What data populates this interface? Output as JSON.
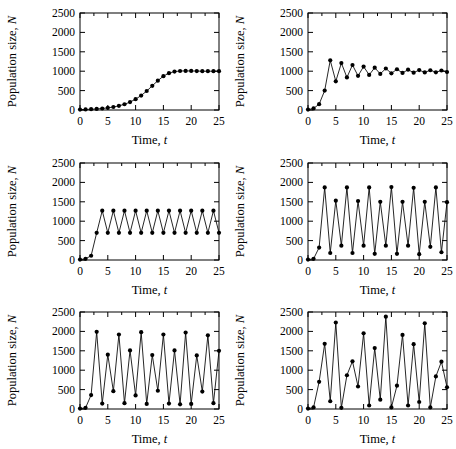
{
  "figure": {
    "panel_count": 6,
    "columns": 2,
    "rows": 3
  },
  "axes": {
    "xlabel_main": "Time, ",
    "xlabel_symbol": "t",
    "ylabel_main": "Population size, ",
    "ylabel_symbol": "N",
    "xticks": [
      0,
      5,
      10,
      15,
      20,
      25
    ],
    "yticks": [
      0,
      500,
      1000,
      1500,
      2000,
      2500
    ],
    "xtick_labels": [
      "0",
      "5",
      "10",
      "15",
      "20",
      "25"
    ],
    "ytick_labels": [
      "0",
      "500",
      "1000",
      "1500",
      "2000",
      "2500"
    ],
    "xlim": [
      0,
      25
    ],
    "ylim": [
      0,
      2500
    ],
    "tick_direction": "in",
    "grid": false,
    "minor_xticks": [
      2.5,
      7.5,
      12.5,
      17.5,
      22.5
    ]
  },
  "style": {
    "line_color": "#000000",
    "marker_color": "#000000",
    "frame_color": "#000000",
    "background": "#ffffff",
    "marker": "filled-circle"
  },
  "chart_data": [
    {
      "type": "line",
      "panel": 1,
      "title": "",
      "xlabel": "Time, t",
      "ylabel": "Population size, N",
      "xlim": [
        0,
        25
      ],
      "ylim": [
        0,
        2500
      ],
      "grid": false,
      "regime": "stable monotonic approach to carrying capacity",
      "x": [
        0,
        1,
        2,
        3,
        4,
        5,
        6,
        7,
        8,
        9,
        10,
        11,
        12,
        13,
        14,
        15,
        16,
        17,
        18,
        19,
        20,
        21,
        22,
        23,
        24,
        25
      ],
      "values": [
        10,
        14,
        20,
        28,
        39,
        55,
        77,
        107,
        148,
        204,
        278,
        373,
        490,
        623,
        757,
        872,
        950,
        990,
        1005,
        1008,
        1006,
        1003,
        1001,
        1000,
        1000,
        1000
      ]
    },
    {
      "type": "line",
      "panel": 2,
      "title": "",
      "xlabel": "Time, t",
      "ylabel": "Population size, N",
      "xlim": [
        0,
        25
      ],
      "ylim": [
        0,
        2500
      ],
      "grid": false,
      "regime": "damped oscillations converging to equilibrium",
      "x": [
        0,
        1,
        2,
        3,
        4,
        5,
        6,
        7,
        8,
        9,
        10,
        11,
        12,
        13,
        14,
        15,
        16,
        17,
        18,
        19,
        20,
        21,
        22,
        23,
        24,
        25
      ],
      "values": [
        10,
        40,
        150,
        500,
        1280,
        740,
        1210,
        840,
        1160,
        880,
        1120,
        905,
        1090,
        930,
        1070,
        945,
        1050,
        955,
        1040,
        962,
        1030,
        968,
        1025,
        972,
        1018,
        980
      ]
    },
    {
      "type": "line",
      "panel": 3,
      "title": "",
      "xlabel": "Time, t",
      "ylabel": "Population size, N",
      "xlim": [
        0,
        25
      ],
      "ylim": [
        0,
        2500
      ],
      "grid": false,
      "regime": "stable two-point limit cycle",
      "x": [
        0,
        1,
        2,
        3,
        4,
        5,
        6,
        7,
        8,
        9,
        10,
        11,
        12,
        13,
        14,
        15,
        16,
        17,
        18,
        19,
        20,
        21,
        22,
        23,
        24,
        25
      ],
      "values": [
        10,
        30,
        110,
        700,
        1270,
        700,
        1270,
        700,
        1270,
        700,
        1270,
        700,
        1270,
        700,
        1270,
        700,
        1270,
        700,
        1270,
        700,
        1270,
        700,
        1270,
        700,
        1270,
        700
      ]
    },
    {
      "type": "line",
      "panel": 4,
      "title": "",
      "xlabel": "Time, t",
      "ylabel": "Population size, N",
      "xlim": [
        0,
        25
      ],
      "ylim": [
        0,
        2500
      ],
      "grid": false,
      "regime": "four-point limit cycle",
      "x": [
        0,
        1,
        2,
        3,
        4,
        5,
        6,
        7,
        8,
        9,
        10,
        11,
        12,
        13,
        14,
        15,
        16,
        17,
        18,
        19,
        20,
        21,
        22,
        23,
        24,
        25
      ],
      "values": [
        10,
        30,
        320,
        1870,
        180,
        1530,
        370,
        1870,
        180,
        1520,
        370,
        1870,
        160,
        1500,
        370,
        1880,
        160,
        1500,
        370,
        1860,
        150,
        1500,
        340,
        1870,
        200,
        1490
      ]
    },
    {
      "type": "line",
      "panel": 5,
      "title": "",
      "xlabel": "Time, t",
      "ylabel": "Population size, N",
      "xlim": [
        0,
        25
      ],
      "ylim": [
        0,
        2500
      ],
      "grid": false,
      "regime": "eight-point limit cycle",
      "x": [
        0,
        1,
        2,
        3,
        4,
        5,
        6,
        7,
        8,
        9,
        10,
        11,
        12,
        13,
        14,
        15,
        16,
        17,
        18,
        19,
        20,
        21,
        22,
        23,
        24,
        25
      ],
      "values": [
        10,
        30,
        360,
        1990,
        140,
        1400,
        460,
        1920,
        150,
        1510,
        350,
        1980,
        130,
        1390,
        470,
        1920,
        140,
        1510,
        120,
        1970,
        130,
        1380,
        450,
        1900,
        150,
        1500
      ]
    },
    {
      "type": "line",
      "panel": 6,
      "title": "",
      "xlabel": "Time, t",
      "ylabel": "Population size, N",
      "xlim": [
        0,
        25
      ],
      "ylim": [
        0,
        2500
      ],
      "grid": false,
      "regime": "chaotic dynamics",
      "x": [
        0,
        1,
        2,
        3,
        4,
        5,
        6,
        7,
        8,
        9,
        10,
        11,
        12,
        13,
        14,
        15,
        16,
        17,
        18,
        19,
        20,
        21,
        22,
        23,
        24,
        25
      ],
      "values": [
        10,
        40,
        700,
        1680,
        200,
        2230,
        30,
        870,
        1230,
        580,
        1950,
        90,
        1570,
        240,
        2380,
        40,
        600,
        1910,
        90,
        1670,
        180,
        2210,
        40,
        840,
        1220,
        560
      ]
    }
  ]
}
